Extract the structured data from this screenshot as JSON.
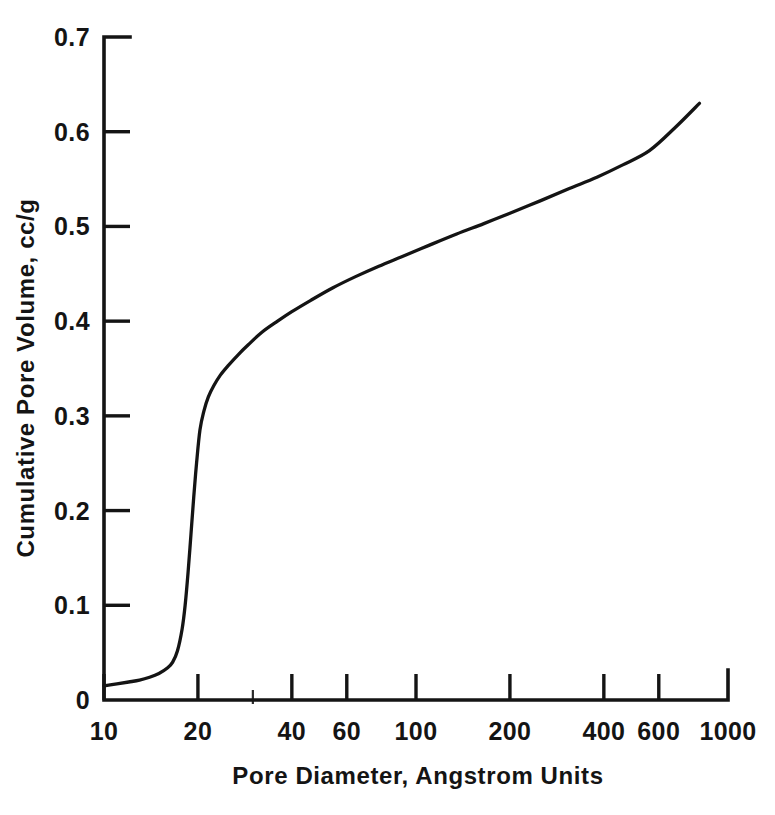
{
  "figure": {
    "background_color": "#ffffff",
    "ink_color": "#141414",
    "x_axis_label": "Pore Diameter, Angstrom Units",
    "y_axis_label": "Cumulative Pore Volume, cc/g"
  },
  "chart_data": {
    "type": "line",
    "title": "",
    "subtitle": "",
    "xlabel": "Pore Diameter, Angstrom Units",
    "ylabel": "Cumulative Pore Volume, cc/g",
    "xscale": "log",
    "yscale": "linear",
    "xlim": [
      10,
      1000
    ],
    "ylim": [
      0,
      0.7
    ],
    "grid": false,
    "legend": false,
    "legend_position": "none",
    "x_tick_labels": [
      "10",
      "20",
      "40",
      "60",
      "100",
      "200",
      "400",
      "600",
      "1000"
    ],
    "x_tick_values": [
      10,
      20,
      40,
      60,
      100,
      200,
      400,
      600,
      1000
    ],
    "x_minor_tick_values": [
      30
    ],
    "y_tick_labels": [
      "0",
      "0.1",
      "0.2",
      "0.3",
      "0.4",
      "0.5",
      "0.6",
      "0.7"
    ],
    "y_tick_values": [
      0,
      0.1,
      0.2,
      0.3,
      0.4,
      0.5,
      0.6,
      0.7
    ],
    "series": [
      {
        "name": "Cumulative pore volume",
        "color": "#141414",
        "x": [
          10,
          11,
          12,
          13,
          14,
          15,
          16,
          16.6,
          17.2,
          17.8,
          18.2,
          18.6,
          19,
          19.4,
          19.8,
          20.3,
          20.9,
          21.6,
          22.5,
          23.6,
          25,
          27,
          29,
          32,
          36,
          40,
          46,
          54,
          64,
          76,
          90,
          110,
          135,
          165,
          200,
          250,
          310,
          380,
          460,
          560,
          680,
          810
        ],
        "y": [
          0.015,
          0.017,
          0.019,
          0.021,
          0.024,
          0.028,
          0.034,
          0.04,
          0.052,
          0.075,
          0.1,
          0.135,
          0.175,
          0.215,
          0.25,
          0.285,
          0.305,
          0.32,
          0.332,
          0.343,
          0.353,
          0.365,
          0.375,
          0.388,
          0.4,
          0.41,
          0.422,
          0.435,
          0.447,
          0.458,
          0.468,
          0.48,
          0.492,
          0.503,
          0.514,
          0.527,
          0.54,
          0.552,
          0.565,
          0.58,
          0.605,
          0.63
        ]
      }
    ],
    "annotations": []
  }
}
